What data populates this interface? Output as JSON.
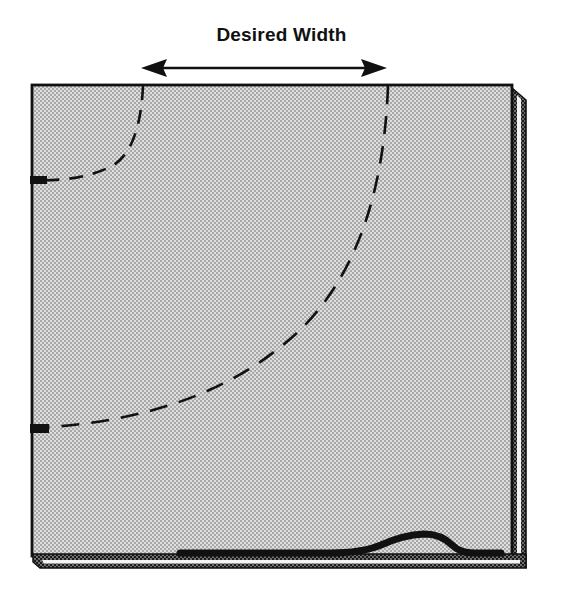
{
  "figure": {
    "title": "Desired Width",
    "domain_label": "sewing-diagram",
    "background_color": "#ffffff",
    "ink_color": "#111111",
    "fabric_fill_color": "#d9d9d9",
    "fabric_stipple_color": "#9a9a9a",
    "fold_highlight_color": "#f2f2f2"
  },
  "caption": {
    "text": "Desired Width",
    "font_size_px": 19,
    "weight": "bold",
    "center_x": 281,
    "baseline_y": 45
  },
  "dimension_arrow": {
    "name": "desired-width-arrow",
    "x_start": 143,
    "x_end": 385,
    "y": 68,
    "stroke_width": 2.4,
    "head_length": 22,
    "head_half_height": 8,
    "double_headed": true
  },
  "fabric_panel": {
    "name": "fabric-rectangle",
    "left": 32,
    "top": 85,
    "right": 512,
    "bottom": 556,
    "outline_width": 2.6,
    "fill": "#d9d9d9",
    "texture": "halftone-checkerboard",
    "texture_cell_px": 3
  },
  "right_fold": {
    "name": "right-selvage-fold",
    "inner_edge_x": 512,
    "gap_left_x": 516,
    "gap_right_x": 521,
    "outer_edge_x": 526,
    "top": 88,
    "bottom": 567,
    "stroke_width": 3.2,
    "gap_fill": "#f2f2f2"
  },
  "bottom_hem": {
    "name": "bottom-hem-fold",
    "upper_line_y": 556,
    "lower_line_y": 567,
    "left": 33,
    "right": 526,
    "stroke_width": 3.0,
    "gap_fill": "#f2f2f2"
  },
  "bump": {
    "name": "fabric-hem-bump",
    "description": "raised curved hem detail near bottom-right",
    "start_x": 330,
    "start_y": 553,
    "peak_x": 424,
    "peak_y": 534,
    "end_x": 500,
    "end_y": 553,
    "stroke_width": 6.5
  },
  "dashed_arcs": [
    {
      "name": "small-curve-dashed",
      "top_anchor_x": 143,
      "top_anchor_y": 86,
      "left_anchor_x": 33,
      "left_anchor_y": 180,
      "dash_pattern": "13 9",
      "stroke_width": 2.4
    },
    {
      "name": "large-curve-dashed",
      "top_anchor_x": 388,
      "top_anchor_y": 86,
      "left_anchor_x": 33,
      "left_anchor_y": 428,
      "dash_pattern": "17 11",
      "stroke_width": 2.4
    }
  ],
  "edge_ticks": [
    {
      "name": "tick-upper-left",
      "x": 31,
      "y": 180,
      "width": 16,
      "height": 7
    },
    {
      "name": "tick-lower-left",
      "x": 31,
      "y": 428,
      "width": 18,
      "height": 8
    }
  ]
}
